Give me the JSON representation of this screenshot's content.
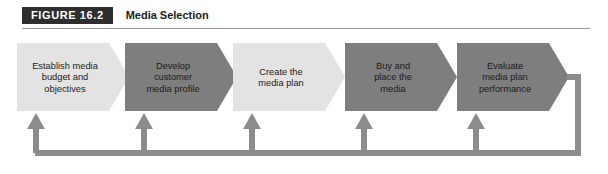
{
  "figure": {
    "badge": "FIGURE 16.2",
    "title": "Media Selection"
  },
  "colors": {
    "badge_bg": "#2e2e2e",
    "badge_text": "#ffffff",
    "title_text": "#1d1d1d",
    "rule": "#9a9a9a",
    "chevron_light": "#e3e3e3",
    "chevron_dark": "#7e7e7e",
    "label_text": "#1c1c1c",
    "feedback_line": "#8c8c8c",
    "page_bg": "#ffffff"
  },
  "flow": {
    "steps": [
      {
        "id": "establish-media-budget-and-objectives",
        "lines": [
          "Establish media",
          "budget and",
          "objectives"
        ],
        "shade": "light"
      },
      {
        "id": "develop-customer-media-profile",
        "lines": [
          "Develop",
          "customer",
          "media profile"
        ],
        "shade": "dark"
      },
      {
        "id": "create-the-media-plan",
        "lines": [
          "Create the",
          "media plan"
        ],
        "shade": "light"
      },
      {
        "id": "buy-and-place-the-media",
        "lines": [
          "Buy and",
          "place the",
          "media"
        ],
        "shade": "dark"
      },
      {
        "id": "evaluate-media-plan-performance",
        "lines": [
          "Evaluate",
          "media plan",
          "performance"
        ],
        "shade": "dark"
      }
    ],
    "feedback_loop": {
      "arrow_count": 5,
      "direction": "right-to-left-return"
    }
  }
}
